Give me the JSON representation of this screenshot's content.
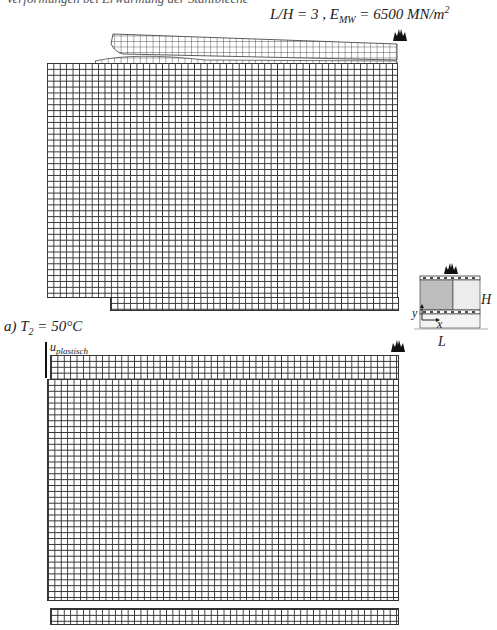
{
  "figure": {
    "cut_off_top_text": "Verformungen bei Erwärmung der Stahlbleche",
    "title": {
      "prefix": "L/H = 3 , E",
      "sub": "MW",
      "middle": " = 6500 MN/m",
      "sup": "2"
    },
    "caption": {
      "prefix": "a) T",
      "sub": "2",
      "suffix": " = 50°C"
    },
    "plastic_displacement_label": {
      "base": "u",
      "sub": "plastisch"
    },
    "icons": {
      "top_flame": "flame-icon",
      "lower_flame": "flame-icon",
      "diagram_flame": "flame-icon"
    },
    "schematic": {
      "label_height": "H",
      "label_length": "L",
      "axis_x": "x",
      "axis_y": "y",
      "shaded_fill": "#bdbdbd",
      "unshaded_fill": "#ececec"
    },
    "meshes": [
      {
        "name": "upper-deformed-mesh",
        "description": "FE mesh with curled top face sheet"
      },
      {
        "name": "lower-deformed-mesh",
        "description": "FE mesh with plastic displacement"
      }
    ]
  }
}
